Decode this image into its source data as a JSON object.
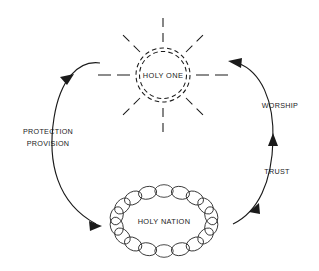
{
  "diagram": {
    "background_color": "#ffffff",
    "ink_color": "#1a1a1a",
    "nodes": {
      "holy_one": {
        "label": "HOLY ONE",
        "icon": "radiant-sun-icon",
        "shape": "dashed-double-circle",
        "ray_count": 8,
        "center_x": 163,
        "center_y": 75,
        "radius": 27
      },
      "holy_nation": {
        "label": "HOLY NATION",
        "icon": "chain-ring-icon",
        "shape": "interlocking-chain-ellipse",
        "link_count": 18,
        "center_x": 164,
        "center_y": 221,
        "radius_x": 48,
        "radius_y": 30
      }
    },
    "edges": {
      "downward": {
        "from": "holy_one",
        "to": "holy_nation",
        "label_line1": "PROTECTION",
        "label_line2": "PROVISION",
        "direction": "holy-one-to-holy-nation",
        "side": "left"
      },
      "upward": {
        "from": "holy_nation",
        "to": "holy_one",
        "label_line1": "WORSHIP",
        "label_line2": "TRUST",
        "direction": "holy-nation-to-holy-one",
        "side": "right"
      }
    }
  }
}
